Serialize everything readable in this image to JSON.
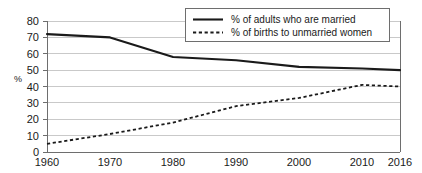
{
  "chart_data": {
    "type": "line",
    "title": "",
    "xlabel": "",
    "ylabel": "%",
    "x": [
      1960,
      1970,
      1980,
      1990,
      2000,
      2010,
      2016
    ],
    "categories": [
      "1960",
      "1970",
      "1980",
      "1990",
      "2000",
      "2010",
      "2016"
    ],
    "xlim": [
      1960,
      2016
    ],
    "ylim": [
      0,
      80
    ],
    "yticks": [
      0,
      10,
      20,
      30,
      40,
      50,
      60,
      70,
      80
    ],
    "ytick_labels": [
      "0",
      "10",
      "20",
      "30",
      "40",
      "50",
      "60",
      "70",
      "80"
    ],
    "grid": "horizontal",
    "legend_position": "top-right",
    "series": [
      {
        "name": "% of adults who are married",
        "style": "solid",
        "color": "#1a1a1a",
        "values": [
          72,
          70,
          58,
          56,
          52,
          51,
          50
        ]
      },
      {
        "name": "% of births to unmarried women",
        "style": "dashed",
        "color": "#1a1a1a",
        "values": [
          5,
          11,
          18,
          28,
          33,
          41,
          40
        ]
      }
    ]
  },
  "axes": {
    "y_axis_label": "%",
    "y_tick_0": "0",
    "y_tick_10": "10",
    "y_tick_20": "20",
    "y_tick_30": "30",
    "y_tick_40": "40",
    "y_tick_50": "50",
    "y_tick_60": "60",
    "y_tick_70": "70",
    "y_tick_80": "80",
    "x_tick_1960": "1960",
    "x_tick_1970": "1970",
    "x_tick_1980": "1980",
    "x_tick_1990": "1990",
    "x_tick_2000": "2000",
    "x_tick_2010": "2010",
    "x_tick_2016": "2016"
  },
  "legend": {
    "entry_solid": "% of adults who are married",
    "entry_dashed": "% of births to unmarried women"
  },
  "colors": {
    "line": "#1a1a1a",
    "grid": "#c9c9c9",
    "axis": "#6e6e6e",
    "background": "#ffffff"
  }
}
